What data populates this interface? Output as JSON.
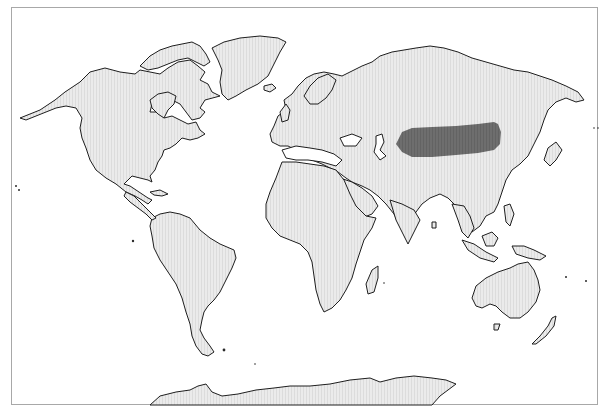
{
  "map": {
    "projection": "world (Robinson-like)",
    "background_color": "#ffffff",
    "frame_color": "#a8a8a8",
    "land_fill": "#e8e8e8",
    "coastline_color": "#1e1e1e",
    "highlight": {
      "region": "Central Asia / Mongolia",
      "color": "#6b6b6b"
    },
    "continents": [
      "North America",
      "Greenland",
      "South America",
      "Europe",
      "Africa",
      "Asia",
      "Australia",
      "New Zealand",
      "Antarctica"
    ]
  }
}
